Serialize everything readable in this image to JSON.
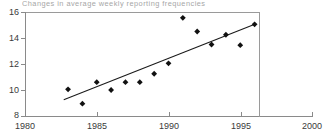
{
  "chart_data": {
    "type": "scatter",
    "title": "Changes in average weekly reporting frequencies",
    "xlabel": "",
    "ylabel": "",
    "xlim": [
      1980,
      2000
    ],
    "ylim": [
      8,
      16
    ],
    "xticks": [
      1980,
      1985,
      1990,
      1995,
      2000
    ],
    "yticks": [
      8,
      10,
      12,
      14,
      16
    ],
    "grid": false,
    "legend": "none",
    "series": [
      {
        "name": "average weekly reporting frequency",
        "marker": "diamond",
        "color": "#111111",
        "x": [
          1983,
          1984,
          1985,
          1986,
          1987,
          1988,
          1989,
          1990,
          1991,
          1992,
          1993,
          1994,
          1995,
          1996
        ],
        "values": [
          10.05,
          8.95,
          10.6,
          10.0,
          10.6,
          10.6,
          11.25,
          12.05,
          15.55,
          14.5,
          13.5,
          14.25,
          13.45,
          15.05
        ]
      },
      {
        "name": "trend line",
        "type": "line",
        "color": "#1a1a1a",
        "x": [
          1982.7,
          1996.1
        ],
        "values": [
          9.25,
          15.1
        ]
      }
    ]
  },
  "axes": {
    "y_labels": [
      "16",
      "14",
      "12",
      "10",
      "8"
    ],
    "x_labels": [
      "1980",
      "1985",
      "1990",
      "1995",
      "2000"
    ]
  }
}
